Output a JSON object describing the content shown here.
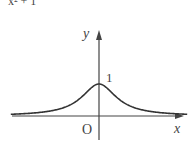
{
  "caption_fragment": "x² + 1",
  "chart_data": {
    "type": "line",
    "title": "",
    "function": "y = 1/(x^2 + 1)",
    "xlabel": "x",
    "ylabel": "y",
    "origin_label": "O",
    "y_tick_labels": [
      "1"
    ],
    "xlim": [
      -4.2,
      4.2
    ],
    "ylim": [
      0,
      1.6
    ],
    "grid": false,
    "legend": "none",
    "series": [
      {
        "name": "y = 1/(x^2+1)",
        "x": [
          -4,
          -3.5,
          -3,
          -2.5,
          -2,
          -1.5,
          -1,
          -0.5,
          0,
          0.5,
          1,
          1.5,
          2,
          2.5,
          3,
          3.5,
          4
        ],
        "y": [
          0.059,
          0.075,
          0.1,
          0.138,
          0.2,
          0.308,
          0.5,
          0.8,
          1.0,
          0.8,
          0.5,
          0.308,
          0.2,
          0.138,
          0.1,
          0.075,
          0.059
        ]
      }
    ],
    "colors": {
      "curve": "#333333",
      "axes": "#444444",
      "text": "#444444"
    }
  }
}
